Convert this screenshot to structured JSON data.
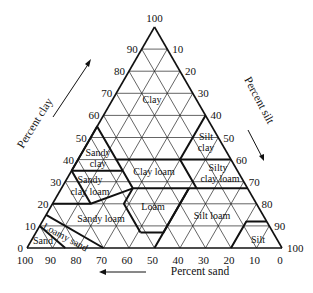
{
  "axes": {
    "clay": {
      "label": "Percent clay",
      "ticks": [
        "0",
        "10",
        "20",
        "30",
        "40",
        "50",
        "60",
        "70",
        "80",
        "90",
        "100"
      ]
    },
    "silt": {
      "label": "Percent silt",
      "ticks": [
        "10",
        "20",
        "30",
        "40",
        "50",
        "60",
        "70",
        "80",
        "90",
        "100"
      ]
    },
    "sand": {
      "label": "Percent sand",
      "ticks": [
        "100",
        "90",
        "80",
        "70",
        "60",
        "50",
        "40",
        "30",
        "20",
        "10",
        "0"
      ]
    }
  },
  "classes": [
    {
      "name": "Clay",
      "lines": [
        "Clay"
      ]
    },
    {
      "name": "Silty clay",
      "lines": [
        "Silt",
        "clay"
      ]
    },
    {
      "name": "Sandy clay",
      "lines": [
        "Sandy",
        "clay"
      ]
    },
    {
      "name": "Clay loam",
      "lines": [
        "Clay loam"
      ]
    },
    {
      "name": "Silty clay loam",
      "lines": [
        "Silty",
        "clay loam"
      ]
    },
    {
      "name": "Sandy clay loam",
      "lines": [
        "Sandy",
        "clay loam"
      ]
    },
    {
      "name": "Loam",
      "lines": [
        "Loam"
      ]
    },
    {
      "name": "Silt loam",
      "lines": [
        "Silt loam"
      ]
    },
    {
      "name": "Sandy loam",
      "lines": [
        "Sandy loam"
      ]
    },
    {
      "name": "Loamy sand",
      "lines": [
        "Loamy sand"
      ]
    },
    {
      "name": "Sand",
      "lines": [
        "Sand"
      ]
    },
    {
      "name": "Silt",
      "lines": [
        "Silt"
      ]
    }
  ]
}
